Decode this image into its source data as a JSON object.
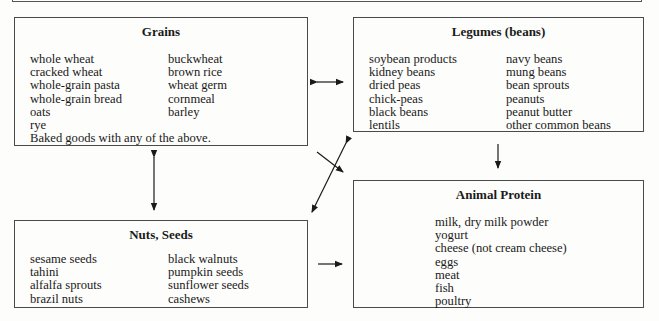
{
  "diagram": {
    "boxes": {
      "grains": {
        "title": "Grains",
        "col1": [
          "whole wheat",
          "cracked wheat",
          "whole-grain pasta",
          "whole-grain bread",
          "oats",
          "rye"
        ],
        "col2": [
          "buckwheat",
          "brown rice",
          "wheat germ",
          "cornmeal",
          "barley"
        ],
        "footer": "Baked goods with any of the above."
      },
      "legumes": {
        "title": "Legumes (beans)",
        "col1": [
          "soybean products",
          "kidney beans",
          "dried peas",
          "chick-peas",
          "black beans",
          "lentils"
        ],
        "col2": [
          "navy beans",
          "mung beans",
          "bean sprouts",
          "peanuts",
          "peanut butter",
          "other common beans"
        ]
      },
      "nuts_seeds": {
        "title": "Nuts, Seeds",
        "col1": [
          "sesame seeds",
          "tahini",
          "alfalfa sprouts",
          "brazil nuts"
        ],
        "col2": [
          "black walnuts",
          "pumpkin seeds",
          "sunflower seeds",
          "cashews"
        ]
      },
      "animal_protein": {
        "title": "Animal Protein",
        "items": [
          "milk, dry milk powder",
          "yogurt",
          "cheese (not cream cheese)",
          "eggs",
          "meat",
          "fish",
          "poultry"
        ]
      }
    },
    "connections": [
      {
        "from": "Grains",
        "to": "Legumes (beans)",
        "type": "bidirectional"
      },
      {
        "from": "Grains",
        "to": "Nuts, Seeds",
        "type": "bidirectional"
      },
      {
        "from": "Legumes (beans)",
        "to": "Animal Protein",
        "type": "directed"
      },
      {
        "from": "Nuts, Seeds",
        "to": "Animal Protein",
        "type": "directed"
      },
      {
        "from": "Grains",
        "to": "Animal Protein",
        "type": "directed"
      },
      {
        "from": "Legumes (beans)",
        "to": "Nuts, Seeds",
        "type": "directed"
      }
    ],
    "colors": {
      "line": "#1a1a1a",
      "border": "#4a4a4a",
      "background": "#fdfdfb"
    }
  }
}
